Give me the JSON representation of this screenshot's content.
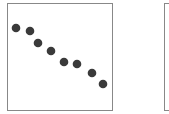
{
  "chart_data": [
    {
      "type": "scatter",
      "title": "",
      "xlabel": "",
      "ylabel": "",
      "grid": false,
      "marker_color": "#3a3a3a",
      "points_px": [
        [
          16,
          28
        ],
        [
          30,
          31
        ],
        [
          38,
          43
        ],
        [
          51,
          51
        ],
        [
          64,
          62
        ],
        [
          77,
          64
        ],
        [
          92,
          73
        ],
        [
          103,
          84
        ]
      ],
      "x": [
        1,
        2,
        3,
        4,
        5,
        6,
        7,
        8
      ],
      "y": [
        8,
        7.7,
        6.6,
        5.8,
        4.8,
        4.6,
        3.8,
        2.8
      ],
      "trend": "negative"
    },
    {
      "type": "scatter",
      "note": "second panel, cropped at right edge; no visible points",
      "x": [],
      "y": []
    }
  ]
}
